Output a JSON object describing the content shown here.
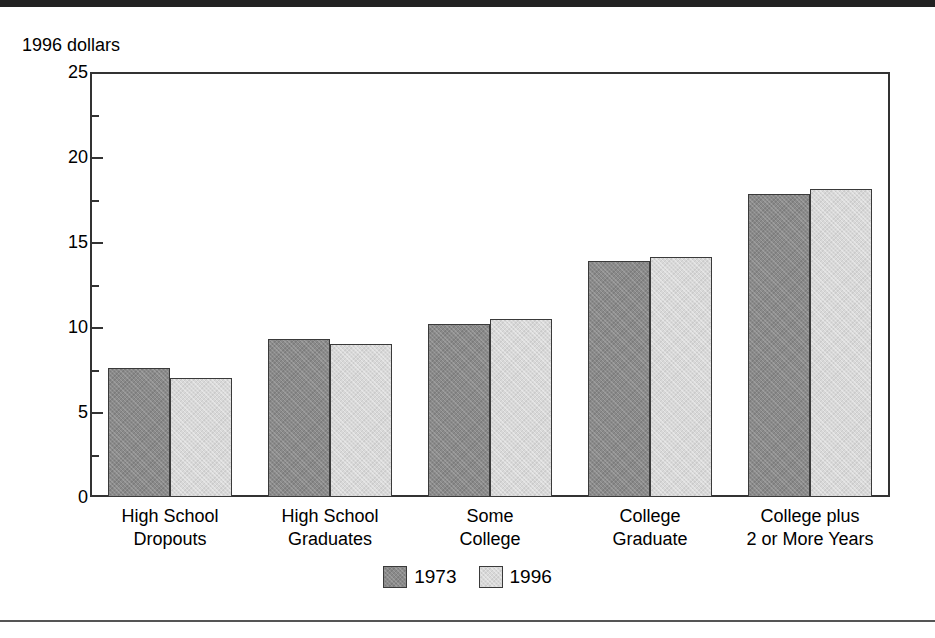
{
  "figure": {
    "y_axis_title": "1996 dollars",
    "top_rule_color": "#222222",
    "bottom_rule_color": "#555555"
  },
  "chart_data": {
    "type": "bar",
    "title": "",
    "subtitle": "",
    "xlabel": "",
    "ylabel": "1996 dollars",
    "ylim": [
      0,
      25
    ],
    "yticks": [
      0,
      5,
      10,
      15,
      20,
      25
    ],
    "ytick_labels": [
      "0",
      "5",
      "10",
      "15",
      "20",
      "25"
    ],
    "minor_yticks": [
      2.5,
      7.5,
      12.5,
      17.5,
      22.5
    ],
    "grid": false,
    "legend_position": "bottom-center",
    "categories": [
      "High School Dropouts",
      "High School Graduates",
      "Some College",
      "College Graduate",
      "College plus 2 or More Years"
    ],
    "category_lines": [
      [
        "High School",
        "Dropouts"
      ],
      [
        "High School",
        "Graduates"
      ],
      [
        "Some",
        "College"
      ],
      [
        "College",
        "Graduate"
      ],
      [
        "College plus",
        "2 or More Years"
      ]
    ],
    "series": [
      {
        "name": "1973",
        "color": "#8a8a8a",
        "values": [
          7.6,
          9.3,
          10.2,
          13.9,
          17.8
        ]
      },
      {
        "name": "1996",
        "color": "#d8d8d8",
        "values": [
          7.0,
          9.0,
          10.5,
          14.1,
          18.1
        ]
      }
    ]
  }
}
